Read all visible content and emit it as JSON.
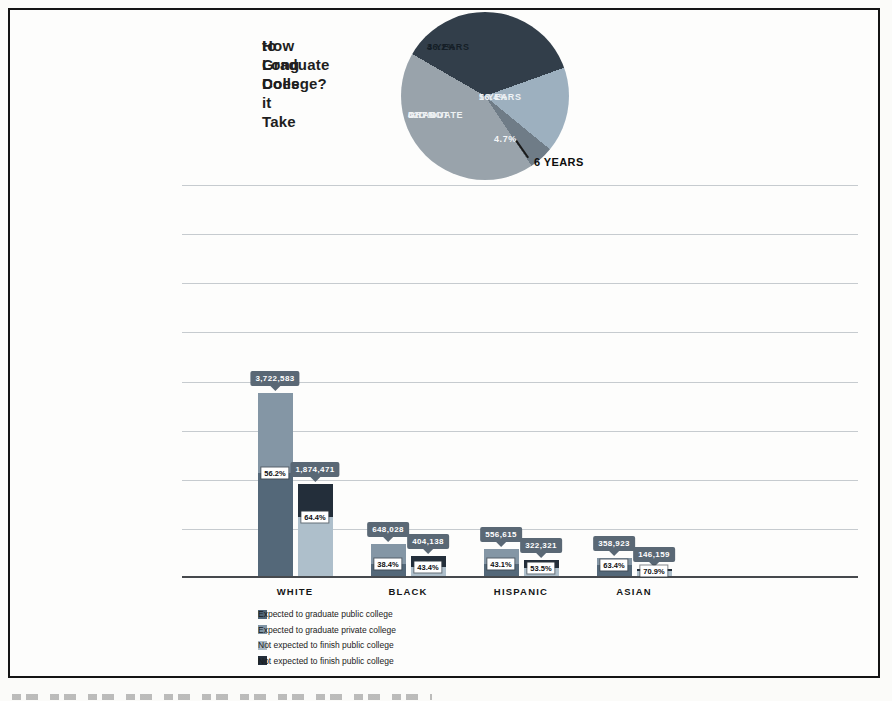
{
  "title": {
    "line1": "How Long Does it Take",
    "line2": "to Graduate College?"
  },
  "chart_data": [
    {
      "type": "pie",
      "title": "How Long Does it Take to Graduate College?",
      "start_angle_deg": 300,
      "slices": [
        {
          "label": "4 YEARS",
          "pct": "36.2%",
          "value": 36.2,
          "color": "#323e4a",
          "text_color": "#151e27"
        },
        {
          "label": "5 YEARS",
          "pct": "16.4%",
          "value": 16.4,
          "color": "#9db0bf",
          "text_color": "#eef2f5"
        },
        {
          "label": "6 YEARS",
          "pct": "4.7%",
          "value": 4.7,
          "color": "#6f7c87",
          "text_color": "#f3f5f7",
          "label_outside": true
        },
        {
          "label": "DID NOT GRADUATE",
          "pct": "42.7%",
          "value": 42.7,
          "color": "#99a3ab",
          "text_color": "#eef1f3",
          "label_lines": [
            "DID NOT",
            "GRADUATE"
          ]
        }
      ],
      "outside_label": "6 YEARS"
    },
    {
      "type": "bar",
      "stacked": true,
      "categories": [
        "WHITE",
        "BLACK",
        "HISPANIC",
        "ASIAN"
      ],
      "ylim": [
        0,
        8000000
      ],
      "gridline_step": 1000000,
      "grid": true,
      "groups": [
        {
          "category": "WHITE",
          "bars": [
            {
              "kind": "public",
              "total_label": "3,722,583",
              "total": 3722583,
              "graduate_pct_label": "56.2%",
              "graduate_pct": 56.2
            },
            {
              "kind": "private",
              "total_label": "1,874,471",
              "total": 1874471,
              "graduate_pct_label": "64.4%",
              "graduate_pct": 64.4
            }
          ]
        },
        {
          "category": "BLACK",
          "bars": [
            {
              "kind": "public",
              "total_label": "648,028",
              "total": 648028,
              "graduate_pct_label": "38.4%",
              "graduate_pct": 38.4
            },
            {
              "kind": "private",
              "total_label": "404,138",
              "total": 404138,
              "graduate_pct_label": "43.4%",
              "graduate_pct": 43.4
            }
          ]
        },
        {
          "category": "HISPANIC",
          "bars": [
            {
              "kind": "public",
              "total_label": "556,615",
              "total": 556615,
              "graduate_pct_label": "43.1%",
              "graduate_pct": 43.1
            },
            {
              "kind": "private",
              "total_label": "322,321",
              "total": 322321,
              "graduate_pct_label": "53.5%",
              "graduate_pct": 53.5
            }
          ]
        },
        {
          "category": "ASIAN",
          "bars": [
            {
              "kind": "public",
              "total_label": "358,923",
              "total": 358923,
              "graduate_pct_label": "63.4%",
              "graduate_pct": 63.4
            },
            {
              "kind": "private",
              "total_label": "146,159",
              "total": 146159,
              "graduate_pct_label": "70.9%",
              "graduate_pct": 70.9
            }
          ]
        }
      ],
      "legend": [
        {
          "label": "Expected to graduate public college",
          "color": "#4f6577"
        },
        {
          "label": "Expected to graduate private college",
          "color": "#8196a6"
        },
        {
          "label": "Not expected to finish public college",
          "color": "#aab9c5"
        },
        {
          "label": "Not expected to finish public college",
          "color": "#222d39"
        }
      ],
      "colors": {
        "expected_public": "#546879",
        "not_expected_public": "#8496a5",
        "expected_private": "#aebfcb",
        "not_expected_private": "#232e3a",
        "callout_bg": "#5a6875",
        "callout_text": "#ffffff",
        "pct_box_bg": "#ffffff",
        "pct_box_text": "#0e0e10",
        "gridline": "#c6cbcf",
        "baseline": "#46494d"
      }
    }
  ]
}
